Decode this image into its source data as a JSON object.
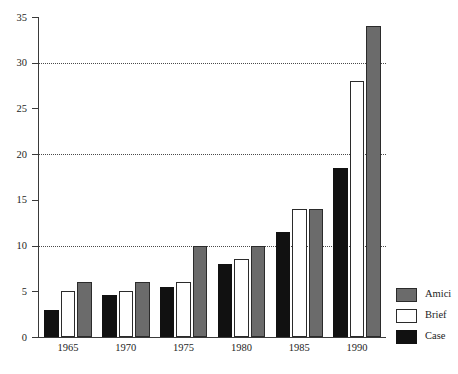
{
  "chart_data": {
    "type": "bar",
    "title": "",
    "subtitle": "",
    "xlabel": "",
    "ylabel": "",
    "categories": [
      "1965",
      "1970",
      "1975",
      "1980",
      "1985",
      "1990"
    ],
    "series": [
      {
        "name": "Case",
        "color": "#111111",
        "values": [
          3,
          4.6,
          5.5,
          8,
          11.5,
          18.5
        ]
      },
      {
        "name": "Brief",
        "color": "#ffffff",
        "values": [
          5,
          5,
          6,
          8.5,
          14,
          28
        ]
      },
      {
        "name": "Amici",
        "color": "#6b6b6b",
        "values": [
          6,
          6,
          10,
          10,
          14,
          34
        ]
      }
    ],
    "ylim": [
      0,
      35
    ],
    "yticks": [
      0,
      5,
      10,
      15,
      20,
      25,
      30,
      35
    ],
    "ytick_labels": [
      "0",
      "5",
      "10",
      "15",
      "20",
      "25",
      "30",
      "35"
    ],
    "gridlines_at": [
      10,
      20,
      30
    ],
    "grid": "dotted-horizontal-at-10-20-30",
    "legend_position": "right-bottom",
    "legend": [
      {
        "label": "Amici",
        "swatch": "amici"
      },
      {
        "label": "Brief",
        "swatch": "brief"
      },
      {
        "label": "Case",
        "swatch": "case"
      }
    ]
  }
}
